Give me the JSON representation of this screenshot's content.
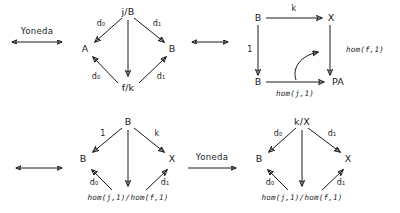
{
  "figure": {
    "kind": "commutative-diagrams",
    "panels": 4,
    "relations": [
      "Yoneda",
      "equivalence"
    ]
  },
  "connectors": {
    "yoneda_top_label": "Yoneda",
    "yoneda_bottom_label": "Yoneda",
    "equiv_top_middle": "",
    "equiv_row2_left": "",
    "equiv_left_rows": ""
  },
  "panel1": {
    "name": "slice-comma-diamond",
    "nodes": {
      "apex": "j/B",
      "left": "A",
      "right": "B",
      "bottom": "f/k"
    },
    "edges": {
      "apex_left": "d₀",
      "apex_right": "d₁",
      "bottom_left": "d₀",
      "bottom_right": "d₁",
      "apex_bottom": ""
    }
  },
  "panel2": {
    "name": "hom-square",
    "nodes": {
      "top_left": "B",
      "top_right": "X",
      "bottom_left": "B",
      "bottom_right": "PA"
    },
    "edges": {
      "top": "k",
      "left": "1",
      "right": "hom(f,1)",
      "bottom": "hom(j,1)",
      "curved": ""
    }
  },
  "panel3": {
    "name": "hom-quotient-diamond-left",
    "nodes": {
      "apex": "B",
      "left": "B",
      "right": "X",
      "bottom": "hom(j,1)/hom(f,1)"
    },
    "edges": {
      "apex_left": "1",
      "apex_right": "k",
      "bottom_left": "d₀",
      "bottom_right": "d₁",
      "apex_bottom": ""
    }
  },
  "panel4": {
    "name": "hom-quotient-diamond-right",
    "nodes": {
      "apex": "k/X",
      "left": "B",
      "right": "X",
      "bottom": "hom(j,1)/hom(f,1)"
    },
    "edges": {
      "apex_left": "d₀",
      "apex_right": "d₁",
      "bottom_left": "d₀",
      "bottom_right": "d₁",
      "apex_bottom": ""
    }
  },
  "colors": {
    "ink": "#1a1a1a",
    "background": "#ffffff"
  }
}
